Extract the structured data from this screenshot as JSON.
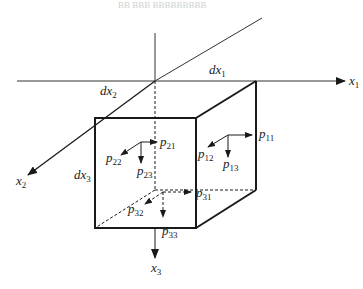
{
  "header": {
    "text": "BB BBB BBBBBBBBB"
  },
  "axes": {
    "x1": {
      "base": "x",
      "sub": "1"
    },
    "x2": {
      "base": "x",
      "sub": "2"
    },
    "x3": {
      "base": "x",
      "sub": "3"
    }
  },
  "dimensions": {
    "dx1": {
      "base": "dx",
      "sub": "1"
    },
    "dx2": {
      "base": "dx",
      "sub": "2"
    },
    "dx3": {
      "base": "dx",
      "sub": "3"
    }
  },
  "stresses": {
    "p11": {
      "base": "p",
      "sub": "11"
    },
    "p12": {
      "base": "p",
      "sub": "12"
    },
    "p13": {
      "base": "p",
      "sub": "13"
    },
    "p21": {
      "base": "p",
      "sub": "21"
    },
    "p22": {
      "base": "p",
      "sub": "22"
    },
    "p23": {
      "base": "p",
      "sub": "23"
    },
    "p31": {
      "base": "p",
      "sub": "31"
    },
    "p32": {
      "base": "p",
      "sub": "32"
    },
    "p33": {
      "base": "p",
      "sub": "33"
    }
  },
  "colors": {
    "line": "#1a1a1a",
    "axis": "#333333"
  }
}
